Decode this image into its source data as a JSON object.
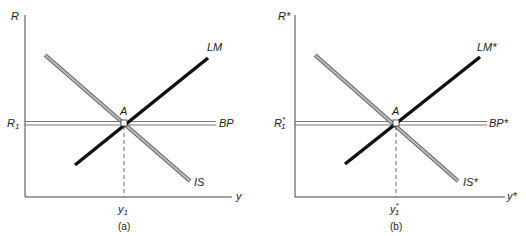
{
  "panels": [
    {
      "caption": "(a)",
      "y_axis_label": "R",
      "x_axis_label": "y",
      "r_label": "R",
      "r_sub": "1",
      "r_sup": "",
      "y_label": "y",
      "y_sub": "1",
      "y_sup": "",
      "point_label": "A",
      "curves": {
        "lm": "LM",
        "bp": "BP",
        "is": "IS"
      }
    },
    {
      "caption": "(b)",
      "y_axis_label": "R*",
      "x_axis_label": "y*",
      "r_label": "R",
      "r_sub": "1",
      "r_sup": "*",
      "y_label": "y",
      "y_sub": "1",
      "y_sup": "*",
      "point_label": "A",
      "curves": {
        "lm": "LM*",
        "bp": "BP*",
        "is": "IS*"
      }
    }
  ],
  "colors": {
    "lm": "#111111",
    "is": "#9a9a9a",
    "axis": "#444444",
    "bp": "#555555"
  }
}
